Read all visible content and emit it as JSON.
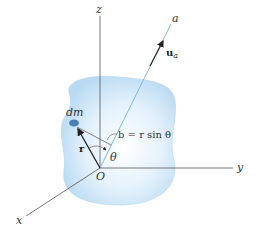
{
  "figure": {
    "axes": {
      "z": "z",
      "y": "y",
      "x": "x",
      "a": "a",
      "origin": "O"
    },
    "labels": {
      "unit_vector_main": "u",
      "unit_vector_sub": "a",
      "mass_element": "dm",
      "position_vector": "r",
      "angle": "θ",
      "perpendicular_distance": "b = r sin θ"
    },
    "colors": {
      "body_fill": "#cfe6f7",
      "body_edge": "#b5d6ef",
      "axis_a": "#7fb8e0",
      "axes": "#555555",
      "dm_blob": "#4a7fb5",
      "arrows": "#222222"
    }
  }
}
